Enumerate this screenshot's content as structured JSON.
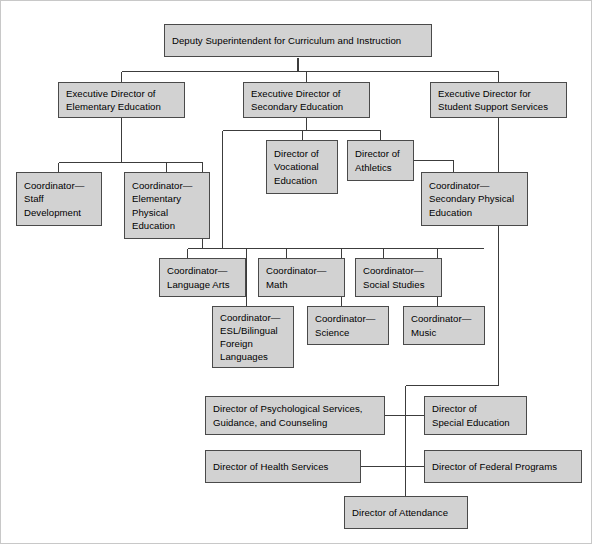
{
  "chart": {
    "type": "org-chart",
    "colors": {
      "node_fill": "#d2d2d2",
      "node_border": "#4a4a4a",
      "connector": "#3c3c3c",
      "background": "#ffffff",
      "text": "#000000"
    },
    "nodes": [
      {
        "id": "deputy-superintendent",
        "label": "Deputy Superintendent for Curriculum and Instruction",
        "level": 0,
        "x": 164,
        "y": 24,
        "w": 268,
        "h": 33
      },
      {
        "id": "exec-director-elementary",
        "label": "Executive Director of\nElementary Education",
        "level": 1,
        "x": 58,
        "y": 82,
        "w": 127,
        "h": 36
      },
      {
        "id": "exec-director-secondary",
        "label": "Executive Director of\nSecondary Education",
        "level": 1,
        "x": 243,
        "y": 82,
        "w": 127,
        "h": 36
      },
      {
        "id": "exec-director-student-support",
        "label": "Executive Director for\nStudent Support Services",
        "level": 1,
        "x": 430,
        "y": 82,
        "w": 137,
        "h": 36
      },
      {
        "id": "coordinator-staff-development",
        "label": "Coordinator—\nStaff\nDevelopment",
        "level": 2,
        "x": 16,
        "y": 172,
        "w": 86,
        "h": 54
      },
      {
        "id": "coordinator-elementary-physical-education",
        "label": "Coordinator—\nElementary\nPhysical\nEducation",
        "level": 2,
        "x": 124,
        "y": 172,
        "w": 86,
        "h": 67
      },
      {
        "id": "director-vocational-education",
        "label": "Director of\nVocational\nEducation",
        "level": 2,
        "x": 266,
        "y": 140,
        "w": 72,
        "h": 54
      },
      {
        "id": "director-athletics",
        "label": "Director of\nAthletics",
        "level": 2,
        "x": 347,
        "y": 140,
        "w": 67,
        "h": 41
      },
      {
        "id": "coordinator-secondary-physical-education",
        "label": "Coordinator—\nSecondary Physical\nEducation",
        "level": 3,
        "x": 421,
        "y": 172,
        "w": 107,
        "h": 54
      },
      {
        "id": "coordinator-language-arts",
        "label": "Coordinator—\nLanguage Arts",
        "level": 3,
        "x": 159,
        "y": 258,
        "w": 87,
        "h": 39
      },
      {
        "id": "coordinator-math",
        "label": "Coordinator—\nMath",
        "level": 3,
        "x": 258,
        "y": 258,
        "w": 87,
        "h": 39
      },
      {
        "id": "coordinator-social-studies",
        "label": "Coordinator—\nSocial Studies",
        "level": 3,
        "x": 355,
        "y": 258,
        "w": 87,
        "h": 39
      },
      {
        "id": "coordinator-esl-bilingual",
        "label": "Coordinator—\nESL/Bilingual\nForeign\nLanguages",
        "level": 4,
        "x": 212,
        "y": 306,
        "w": 82,
        "h": 62
      },
      {
        "id": "coordinator-science",
        "label": "Coordinator—\nScience",
        "level": 4,
        "x": 307,
        "y": 306,
        "w": 82,
        "h": 39
      },
      {
        "id": "coordinator-music",
        "label": "Coordinator—\nMusic",
        "level": 4,
        "x": 403,
        "y": 306,
        "w": 82,
        "h": 39
      },
      {
        "id": "director-psychological-services",
        "label": "Director of Psychological Services,\nGuidance, and Counseling",
        "level": 2,
        "x": 205,
        "y": 396,
        "w": 180,
        "h": 39
      },
      {
        "id": "director-special-education",
        "label": "Director of\nSpecial Education",
        "level": 2,
        "x": 424,
        "y": 396,
        "w": 103,
        "h": 39
      },
      {
        "id": "director-health-services",
        "label": "Director of Health Services",
        "level": 2,
        "x": 205,
        "y": 450,
        "w": 156,
        "h": 33
      },
      {
        "id": "director-federal-programs",
        "label": "Director of Federal Programs",
        "level": 2,
        "x": 424,
        "y": 450,
        "w": 158,
        "h": 33
      },
      {
        "id": "director-attendance",
        "label": "Director of Attendance",
        "level": 2,
        "x": 344,
        "y": 496,
        "w": 124,
        "h": 33
      }
    ],
    "edges": [
      {
        "from": "deputy-superintendent",
        "to": "exec-director-elementary"
      },
      {
        "from": "deputy-superintendent",
        "to": "exec-director-secondary"
      },
      {
        "from": "deputy-superintendent",
        "to": "exec-director-student-support"
      },
      {
        "from": "exec-director-elementary",
        "to": "coordinator-staff-development"
      },
      {
        "from": "exec-director-elementary",
        "to": "coordinator-elementary-physical-education"
      },
      {
        "from": "exec-director-elementary",
        "to": "coordinator-language-arts"
      },
      {
        "from": "exec-director-secondary",
        "to": "director-vocational-education"
      },
      {
        "from": "exec-director-secondary",
        "to": "director-athletics"
      },
      {
        "from": "exec-director-secondary",
        "to": "coordinator-language-arts"
      },
      {
        "from": "exec-director-secondary",
        "to": "coordinator-math"
      },
      {
        "from": "exec-director-secondary",
        "to": "coordinator-social-studies"
      },
      {
        "from": "exec-director-secondary",
        "to": "coordinator-esl-bilingual"
      },
      {
        "from": "exec-director-secondary",
        "to": "coordinator-science"
      },
      {
        "from": "exec-director-secondary",
        "to": "coordinator-music"
      },
      {
        "from": "director-athletics",
        "to": "coordinator-secondary-physical-education"
      },
      {
        "from": "exec-director-student-support",
        "to": "director-psychological-services"
      },
      {
        "from": "exec-director-student-support",
        "to": "director-special-education"
      },
      {
        "from": "exec-director-student-support",
        "to": "director-health-services"
      },
      {
        "from": "exec-director-student-support",
        "to": "director-federal-programs"
      },
      {
        "from": "exec-director-student-support",
        "to": "director-attendance"
      }
    ]
  }
}
